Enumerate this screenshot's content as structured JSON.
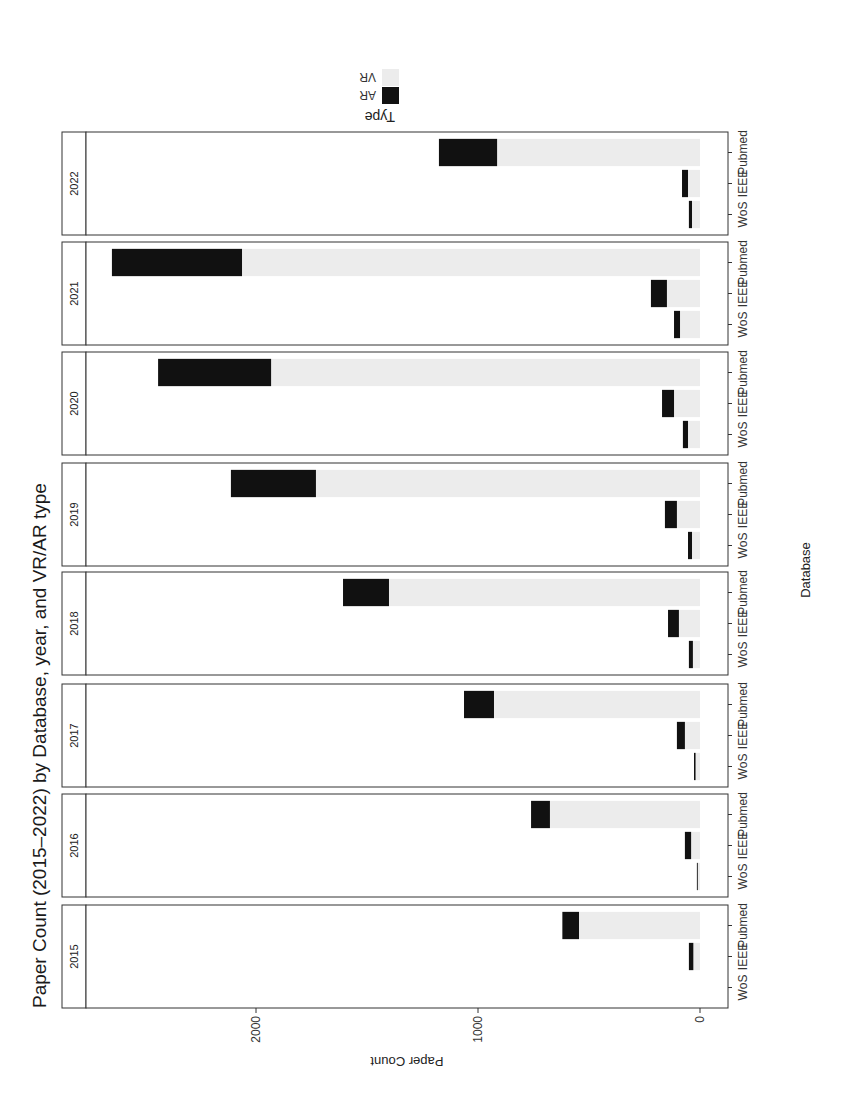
{
  "chart_data": {
    "type": "bar",
    "stacked": true,
    "orientation": "rotated -90deg (page rotated)",
    "title": "Paper Count (2015–2022) by Database, year, and VR/AR type",
    "xlabel": "Database",
    "ylabel": "Paper Count",
    "ylim": [
      0,
      2750
    ],
    "yticks": [
      0,
      1000,
      2000
    ],
    "grid": false,
    "facet_by": "year",
    "facets": [
      "2015",
      "2016",
      "2017",
      "2018",
      "2019",
      "2020",
      "2021",
      "2022"
    ],
    "categories": [
      "WoS",
      "IEEE",
      "Pubmed"
    ],
    "legend": {
      "title": "Type",
      "position": "right",
      "entries": [
        {
          "label": "AR",
          "color": "#111111"
        },
        {
          "label": "VR",
          "color": "#ececec"
        }
      ]
    },
    "series": [
      {
        "name": "VR",
        "color": "#ececec",
        "values_by_facet": {
          "2015": [
            0,
            30,
            545
          ],
          "2016": [
            10,
            40,
            676
          ],
          "2017": [
            20,
            68,
            928
          ],
          "2018": [
            32,
            95,
            1401
          ],
          "2019": [
            36,
            104,
            1730
          ],
          "2020": [
            54,
            117,
            1932
          ],
          "2021": [
            90,
            149,
            2063
          ],
          "2022": [
            36,
            54,
            914
          ]
        }
      },
      {
        "name": "AR",
        "color": "#111111",
        "values_by_facet": {
          "2015": [
            0,
            20,
            75
          ],
          "2016": [
            4,
            28,
            85
          ],
          "2017": [
            7,
            36,
            135
          ],
          "2018": [
            18,
            49,
            207
          ],
          "2019": [
            18,
            54,
            383
          ],
          "2020": [
            23,
            54,
            509
          ],
          "2021": [
            27,
            72,
            586
          ],
          "2022": [
            14,
            27,
            262
          ]
        }
      }
    ]
  }
}
